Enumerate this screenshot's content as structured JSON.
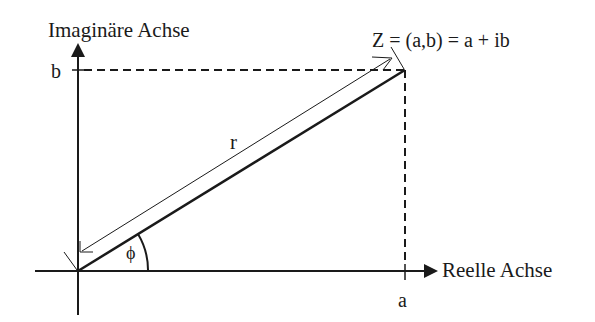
{
  "diagram": {
    "type": "complex-plane",
    "y_axis_title": "Imaginäre Achse",
    "x_axis_title": "Reelle Achse",
    "point_label": "Z = (a,b) = a + ib",
    "x_tick": "a",
    "y_tick": "b",
    "magnitude_label": "r",
    "angle_label": "ϕ",
    "colors": {
      "ink": "#1a1a1a",
      "background": "#ffffff"
    }
  }
}
